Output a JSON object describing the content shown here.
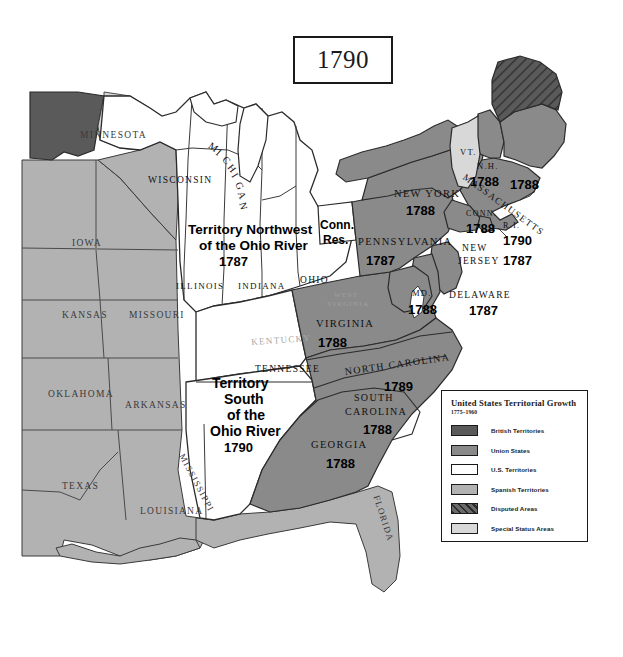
{
  "title": {
    "year": "1790"
  },
  "legend": {
    "title": "United States Territorial Growth",
    "subtitle": "1775–1960",
    "items": [
      {
        "label": "British Territories",
        "color": "#5a5a5a",
        "pattern": "solid"
      },
      {
        "label": "Union States",
        "color": "#8a8a8a",
        "pattern": "solid"
      },
      {
        "label": "U.S. Territories",
        "color": "#ffffff",
        "pattern": "solid"
      },
      {
        "label": "Spanish Territories",
        "color": "#b2b2b2",
        "pattern": "solid"
      },
      {
        "label": "Disputed Areas",
        "color": "#5a5a5a",
        "pattern": "hatch"
      },
      {
        "label": "Special Status Areas",
        "color": "#d8d8d8",
        "pattern": "solid"
      }
    ]
  },
  "map": {
    "states": [
      {
        "name": "MINNESOTA",
        "x": 80,
        "y": 130,
        "size": 9.5,
        "rot": 0,
        "cls": "state-nm",
        "color": "#3a3a3a"
      },
      {
        "name": "WISCONSIN",
        "x": 148,
        "y": 175,
        "size": 9.5,
        "rot": 0,
        "cls": "state-nm",
        "color": "#111"
      },
      {
        "name": "M",
        "x": 213,
        "y": 140,
        "size": 10,
        "rot": 35,
        "cls": "state-nm",
        "color": "#111"
      },
      {
        "name": "I",
        "x": 221,
        "y": 147,
        "size": 10,
        "rot": 40,
        "cls": "state-nm",
        "color": "#111"
      },
      {
        "name": "C",
        "x": 228,
        "y": 154,
        "size": 10,
        "rot": 45,
        "cls": "state-nm",
        "color": "#111"
      },
      {
        "name": "H",
        "x": 234,
        "y": 162,
        "size": 10,
        "rot": 52,
        "cls": "state-nm",
        "color": "#111"
      },
      {
        "name": "I",
        "x": 239,
        "y": 171,
        "size": 10,
        "rot": 58,
        "cls": "state-nm",
        "color": "#111"
      },
      {
        "name": "G",
        "x": 243,
        "y": 180,
        "size": 10,
        "rot": 64,
        "cls": "state-nm",
        "color": "#111"
      },
      {
        "name": "A",
        "x": 246,
        "y": 190,
        "size": 10,
        "rot": 70,
        "cls": "state-nm",
        "color": "#111"
      },
      {
        "name": "N",
        "x": 248,
        "y": 201,
        "size": 10,
        "rot": 76,
        "cls": "state-nm",
        "color": "#111"
      },
      {
        "name": "IOWA",
        "x": 72,
        "y": 238,
        "size": 9.5,
        "rot": 0,
        "cls": "state-nm",
        "color": "#3a3a3a"
      },
      {
        "name": "ILLINOIS",
        "x": 176,
        "y": 281,
        "size": 9,
        "rot": 0,
        "cls": "state-nm",
        "color": "#111"
      },
      {
        "name": "INDIANA",
        "x": 238,
        "y": 281,
        "size": 9,
        "rot": 0,
        "cls": "state-nm",
        "color": "#111"
      },
      {
        "name": "OHIO",
        "x": 300,
        "y": 275,
        "size": 9.5,
        "rot": 0,
        "cls": "state-nm",
        "color": "#111"
      },
      {
        "name": "KANSAS",
        "x": 62,
        "y": 310,
        "size": 9.5,
        "rot": 0,
        "cls": "state-nm",
        "color": "#3a3a3a"
      },
      {
        "name": "MISSOURI",
        "x": 129,
        "y": 310,
        "size": 9.5,
        "rot": 0,
        "cls": "state-nm",
        "color": "#3a3a3a"
      },
      {
        "name": "OKLAHOMA",
        "x": 48,
        "y": 389,
        "size": 9.5,
        "rot": 0,
        "cls": "state-nm",
        "color": "#3a3a3a"
      },
      {
        "name": "ARKANSAS",
        "x": 125,
        "y": 400,
        "size": 9.5,
        "rot": 0,
        "cls": "state-nm",
        "color": "#3a3a3a"
      },
      {
        "name": "TEXAS",
        "x": 62,
        "y": 481,
        "size": 9.5,
        "rot": 0,
        "cls": "state-nm",
        "color": "#3a3a3a"
      },
      {
        "name": "LOUISIANA",
        "x": 140,
        "y": 506,
        "size": 9.5,
        "rot": 0,
        "cls": "state-nm",
        "color": "#3a3a3a"
      },
      {
        "name": "MISSISSIPPI",
        "x": 186,
        "y": 452,
        "size": 9,
        "rot": 62,
        "cls": "state-nm",
        "color": "#3a3a3a"
      },
      {
        "name": "FLORIDA",
        "x": 381,
        "y": 494,
        "size": 9,
        "rot": 72,
        "cls": "state-nm",
        "color": "#3a3a3a"
      },
      {
        "name": "KENTUCKY",
        "x": 251,
        "y": 337,
        "size": 9,
        "rot": -4,
        "cls": "state-nm",
        "color": "#a8a8a8"
      },
      {
        "name": "TENNESSEE",
        "x": 255,
        "y": 364,
        "size": 9.5,
        "rot": 0,
        "cls": "state-nm",
        "color": "#111"
      },
      {
        "name": "WEST",
        "x": 334,
        "y": 291,
        "size": 7,
        "rot": 0,
        "cls": "state-nm",
        "color": "#a0a0a0"
      },
      {
        "name": "VIRGINIA",
        "x": 327,
        "y": 300,
        "size": 7,
        "rot": 0,
        "cls": "state-nm",
        "color": "#a0a0a0"
      },
      {
        "name": "VIRGINIA",
        "x": 316,
        "y": 318,
        "size": 10.5,
        "rot": 0,
        "cls": "state-nm",
        "color": "#111"
      },
      {
        "name": "NORTH CAROLINA",
        "x": 344,
        "y": 366,
        "size": 10,
        "rot": -8,
        "cls": "state-nm",
        "color": "#111"
      },
      {
        "name": "SOUTH",
        "x": 354,
        "y": 392,
        "size": 10,
        "rot": 0,
        "cls": "state-nm",
        "color": "#111"
      },
      {
        "name": "CAROLINA",
        "x": 345,
        "y": 406,
        "size": 10,
        "rot": 0,
        "cls": "state-nm",
        "color": "#111"
      },
      {
        "name": "GEORGIA",
        "x": 311,
        "y": 439,
        "size": 10.5,
        "rot": 0,
        "cls": "state-nm",
        "color": "#111"
      },
      {
        "name": "PENNSYLVANIA",
        "x": 358,
        "y": 236,
        "size": 10.5,
        "rot": 0,
        "cls": "state-nm",
        "color": "#111"
      },
      {
        "name": "NEW YORK",
        "x": 394,
        "y": 188,
        "size": 10.5,
        "rot": 0,
        "cls": "state-nm",
        "color": "#111"
      },
      {
        "name": "MD.",
        "x": 412,
        "y": 288,
        "size": 8.5,
        "rot": 0,
        "cls": "state-nm",
        "color": "#111"
      },
      {
        "name": "DELAWARE",
        "x": 449,
        "y": 290,
        "size": 9.5,
        "rot": 0,
        "cls": "state-nm",
        "color": "#111"
      },
      {
        "name": "NEW",
        "x": 462,
        "y": 243,
        "size": 9.5,
        "rot": 0,
        "cls": "state-nm",
        "color": "#111"
      },
      {
        "name": "JERSEY",
        "x": 458,
        "y": 256,
        "size": 9.5,
        "rot": 0,
        "cls": "state-nm",
        "color": "#111"
      },
      {
        "name": "CONN.",
        "x": 466,
        "y": 209,
        "size": 8,
        "rot": 0,
        "cls": "state-nm",
        "color": "#111"
      },
      {
        "name": "R.I.",
        "x": 503,
        "y": 221,
        "size": 8,
        "rot": 0,
        "cls": "state-nm",
        "color": "#111"
      },
      {
        "name": "MASSACHUSETTS",
        "x": 467,
        "y": 172,
        "size": 9.5,
        "rot": 36,
        "cls": "state-nm",
        "color": "#111"
      },
      {
        "name": "N.H.",
        "x": 477,
        "y": 161,
        "size": 8.5,
        "rot": 0,
        "cls": "state-nm",
        "color": "#111"
      },
      {
        "name": "VT.",
        "x": 460,
        "y": 147,
        "size": 8.5,
        "rot": 0,
        "cls": "state-nm",
        "color": "#111"
      },
      {
        "name": "Conn.",
        "x": 320,
        "y": 218,
        "size": 12,
        "rot": 0,
        "cls": "terr-nm",
        "color": "#000"
      },
      {
        "name": "Res.",
        "x": 323,
        "y": 233,
        "size": 12,
        "rot": 0,
        "cls": "terr-nm",
        "color": "#000"
      }
    ],
    "territory_labels": [
      {
        "text": "Territory Northwest",
        "x": 188,
        "y": 222,
        "size": 13.5
      },
      {
        "text": "of the Ohio River",
        "x": 199,
        "y": 238,
        "size": 13.5
      },
      {
        "text": "Territory",
        "x": 212,
        "y": 375,
        "size": 14
      },
      {
        "text": "South",
        "x": 224,
        "y": 391,
        "size": 14
      },
      {
        "text": "of the",
        "x": 227,
        "y": 407,
        "size": 14
      },
      {
        "text": "Ohio River",
        "x": 210,
        "y": 423,
        "size": 14
      }
    ],
    "years": [
      {
        "text": "1787",
        "x": 219,
        "y": 254,
        "size": 13
      },
      {
        "text": "1790",
        "x": 224,
        "y": 440,
        "size": 13
      },
      {
        "text": "1788",
        "x": 318,
        "y": 335,
        "size": 13
      },
      {
        "text": "1789",
        "x": 384,
        "y": 379,
        "size": 13
      },
      {
        "text": "1788",
        "x": 363,
        "y": 422,
        "size": 13
      },
      {
        "text": "1788",
        "x": 326,
        "y": 456,
        "size": 13
      },
      {
        "text": "1787",
        "x": 366,
        "y": 253,
        "size": 13
      },
      {
        "text": "1788",
        "x": 406,
        "y": 203,
        "size": 13
      },
      {
        "text": "1788",
        "x": 408,
        "y": 302,
        "size": 13
      },
      {
        "text": "1787",
        "x": 469,
        "y": 303,
        "size": 13
      },
      {
        "text": "1787",
        "x": 503,
        "y": 253,
        "size": 13
      },
      {
        "text": "1788",
        "x": 466,
        "y": 221,
        "size": 13
      },
      {
        "text": "1790",
        "x": 503,
        "y": 233,
        "size": 13
      },
      {
        "text": "1788",
        "x": 470,
        "y": 174,
        "size": 13
      },
      {
        "text": "1788",
        "x": 510,
        "y": 177,
        "size": 13
      }
    ]
  },
  "colors": {
    "british": "#5a5a5a",
    "union": "#8a8a8a",
    "us_territory": "#ffffff",
    "spanish": "#b2b2b2",
    "special": "#d8d8d8",
    "outline": "#2b2b2b"
  }
}
